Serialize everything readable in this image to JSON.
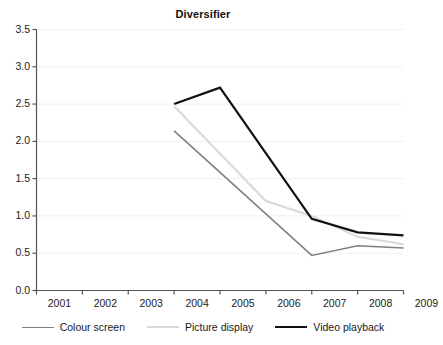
{
  "chart_data": {
    "type": "line",
    "title": "Diversifier",
    "xlabel": "",
    "ylabel": "",
    "x": [
      2001,
      2002,
      2003,
      2004,
      2005,
      2006,
      2007,
      2008,
      2009
    ],
    "xtick_labels": [
      "2001",
      "2002",
      "2003",
      "2004",
      "2005",
      "2006",
      "2007",
      "2008",
      "2009"
    ],
    "ytick_labels": [
      "0.0",
      "0.5",
      "1.0",
      "1.5",
      "2.0",
      "2.5",
      "3.0",
      "3.5"
    ],
    "ytick_values": [
      0.0,
      0.5,
      1.0,
      1.5,
      2.0,
      2.5,
      3.0,
      3.5
    ],
    "ylim": [
      0.0,
      3.5
    ],
    "grid": "horizontal",
    "legend_position": "bottom",
    "series": [
      {
        "name": "Colour screen",
        "color": "#808080",
        "line_width": 1.6,
        "x": [
          2004,
          2005,
          2006,
          2007,
          2008,
          2009
        ],
        "values": [
          2.14,
          null,
          null,
          0.47,
          0.6,
          0.57
        ],
        "points": [
          {
            "x": 2004,
            "y": 2.14
          },
          {
            "x": 2007,
            "y": 0.47
          },
          {
            "x": 2008,
            "y": 0.6
          },
          {
            "x": 2009,
            "y": 0.57
          }
        ]
      },
      {
        "name": "Picture display",
        "color": "#d9d9d9",
        "line_width": 2.0,
        "x": [
          2004,
          2005,
          2006,
          2007,
          2008,
          2009
        ],
        "values": [
          2.47,
          null,
          1.2,
          1.0,
          0.72,
          0.62
        ],
        "points": [
          {
            "x": 2004,
            "y": 2.47
          },
          {
            "x": 2006,
            "y": 1.2
          },
          {
            "x": 2007,
            "y": 1.0
          },
          {
            "x": 2008,
            "y": 0.72
          },
          {
            "x": 2009,
            "y": 0.62
          }
        ]
      },
      {
        "name": "Video playback",
        "color": "#111111",
        "line_width": 2.2,
        "x": [
          2004,
          2005,
          2006,
          2007,
          2008,
          2009
        ],
        "values": [
          2.5,
          2.72,
          null,
          0.96,
          0.78,
          0.74
        ],
        "points": [
          {
            "x": 2004,
            "y": 2.5
          },
          {
            "x": 2005,
            "y": 2.72
          },
          {
            "x": 2007,
            "y": 0.96
          },
          {
            "x": 2008,
            "y": 0.78
          },
          {
            "x": 2009,
            "y": 0.74
          }
        ]
      }
    ]
  },
  "legend": {
    "items": [
      {
        "label": "Colour screen",
        "color": "#808080",
        "width": 1.6
      },
      {
        "label": "Picture display",
        "color": "#d9d9d9",
        "width": 2.0
      },
      {
        "label": "Video playback",
        "color": "#111111",
        "width": 2.2
      }
    ]
  },
  "colors": {
    "axis": "#555555",
    "grid": "#f0f0f0",
    "text": "#1a1a1a",
    "colour_screen": "#808080",
    "picture_display": "#d9d9d9",
    "video_playback": "#111111"
  }
}
